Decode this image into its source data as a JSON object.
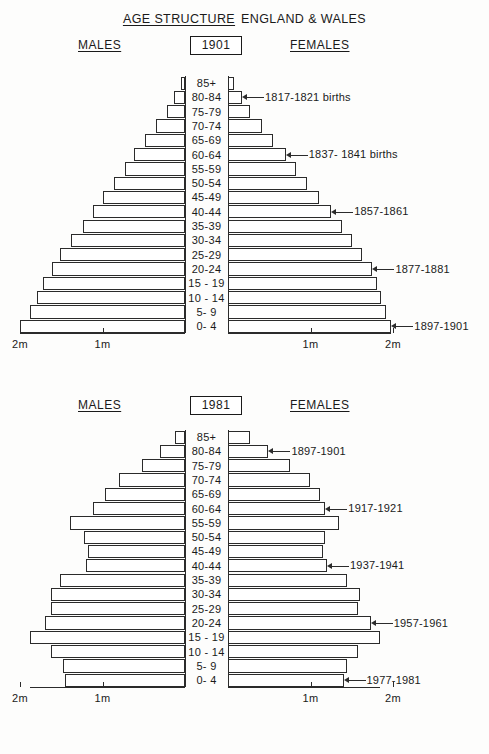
{
  "title": {
    "underlined": "AGE STRUCTURE",
    "plain": "ENGLAND & WALES"
  },
  "labels": {
    "males": "MALES",
    "females": "FEMALES",
    "tick_1m": "1m",
    "tick_2m": "2m"
  },
  "age_groups": [
    "85+",
    "80-84",
    "75-79",
    "70-74",
    "65-69",
    "60-64",
    "55-59",
    "50-54",
    "45-49",
    "40-44",
    "35-39",
    "30-34",
    "25-29",
    "20-24",
    "15 - 19",
    "10 - 14",
    "5-  9",
    "0-  4"
  ],
  "charts": [
    {
      "year": "1901"
    },
    {
      "year": "1981"
    }
  ],
  "chart_data": [
    {
      "type": "bar",
      "orientation": "horizontal",
      "subtype": "population-pyramid",
      "title": "AGE STRUCTURE ENGLAND & WALES",
      "subtitle": "1901",
      "xlabel": "",
      "ylabel": "",
      "categories": [
        "85+",
        "80-84",
        "75-79",
        "70-74",
        "65-69",
        "60-64",
        "55-59",
        "50-54",
        "45-49",
        "40-44",
        "35-39",
        "30-34",
        "25-29",
        "20-24",
        "15 - 19",
        "10 - 14",
        "5-  9",
        "0-  4"
      ],
      "series": [
        {
          "name": "MALES",
          "side": "left",
          "units": "millions",
          "values": [
            0.05,
            0.13,
            0.22,
            0.35,
            0.48,
            0.62,
            0.73,
            0.86,
            1.0,
            1.12,
            1.24,
            1.38,
            1.52,
            1.61,
            1.72,
            1.8,
            1.88,
            2.0
          ]
        },
        {
          "name": "FEMALES",
          "side": "right",
          "units": "millions",
          "values": [
            0.07,
            0.17,
            0.27,
            0.41,
            0.55,
            0.7,
            0.82,
            0.96,
            1.1,
            1.25,
            1.38,
            1.5,
            1.62,
            1.75,
            1.8,
            1.86,
            1.92,
            1.98
          ]
        }
      ],
      "xlim": [
        2,
        0,
        2
      ],
      "xticks": [
        "2m",
        "1m",
        "1m",
        "2m"
      ],
      "grid": false,
      "legend": "none",
      "annotations": [
        {
          "text": "1817-1821 births",
          "category": "80-84",
          "side": "right"
        },
        {
          "text": "1837- 1841 births",
          "category": "60-64",
          "side": "right"
        },
        {
          "text": "1857-1861",
          "category": "40-44",
          "side": "right"
        },
        {
          "text": "1877-1881",
          "category": "20-24",
          "side": "right"
        },
        {
          "text": "1897-1901",
          "category": "0-  4",
          "side": "right"
        }
      ]
    },
    {
      "type": "bar",
      "orientation": "horizontal",
      "subtype": "population-pyramid",
      "title": "AGE STRUCTURE ENGLAND & WALES",
      "subtitle": "1981",
      "xlabel": "",
      "ylabel": "",
      "categories": [
        "85+",
        "80-84",
        "75-79",
        "70-74",
        "65-69",
        "60-64",
        "55-59",
        "50-54",
        "45-49",
        "40-44",
        "35-39",
        "30-34",
        "25-29",
        "20-24",
        "15 - 19",
        "10 - 14",
        "5-  9",
        "0-  4"
      ],
      "series": [
        {
          "name": "MALES",
          "side": "left",
          "units": "millions",
          "values": [
            0.12,
            0.3,
            0.52,
            0.8,
            0.97,
            1.12,
            1.4,
            1.22,
            1.18,
            1.2,
            1.52,
            1.62,
            1.62,
            1.7,
            1.88,
            1.62,
            1.48,
            1.45
          ]
        },
        {
          "name": "FEMALES",
          "side": "right",
          "units": "millions",
          "values": [
            0.27,
            0.49,
            0.75,
            0.99,
            1.12,
            1.18,
            1.34,
            1.18,
            1.15,
            1.2,
            1.44,
            1.6,
            1.58,
            1.73,
            1.84,
            1.58,
            1.44,
            1.4
          ]
        }
      ],
      "xlim": [
        2,
        0,
        2
      ],
      "xticks": [
        "2m",
        "1m",
        "1m",
        "2m"
      ],
      "grid": false,
      "legend": "none",
      "annotations": [
        {
          "text": "1897-1901",
          "category": "80-84",
          "side": "right"
        },
        {
          "text": "1917-1921",
          "category": "60-64",
          "side": "right"
        },
        {
          "text": "1937-1941",
          "category": "40-44",
          "side": "right"
        },
        {
          "text": "1957-1961",
          "category": "20-24",
          "side": "right"
        },
        {
          "text": "1977-1981",
          "category": "0-  4",
          "side": "right"
        }
      ]
    }
  ]
}
